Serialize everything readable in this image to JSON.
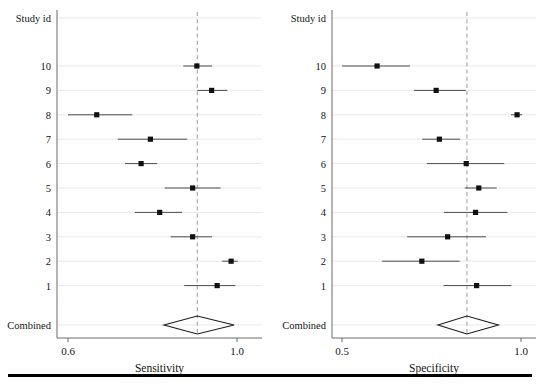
{
  "figure": {
    "title": "",
    "panels": [
      {
        "name": "sensitivity",
        "header": "Study id",
        "axis_title": "Sensitivity",
        "ticks": [
          "0.6",
          "1.0"
        ]
      },
      {
        "name": "specificity",
        "header": "Study id",
        "axis_title": "Specificity",
        "ticks": [
          "0.5",
          "1.0"
        ]
      }
    ],
    "study_labels": [
      "10",
      "9",
      "8",
      "7",
      "6",
      "5",
      "4",
      "3",
      "2",
      "1"
    ],
    "combined_label": "Combined"
  },
  "chart_data": [
    {
      "type": "forest",
      "title": "Sensitivity forest plot",
      "xlabel": "Sensitivity",
      "ylabel": "Study id",
      "xlim": [
        0.555,
        1.02
      ],
      "xticks": [
        0.6,
        1.0
      ],
      "xticklabels": [
        "0.6",
        "1.0"
      ],
      "grid": true,
      "reference_line": 0.906,
      "categories": [
        "10",
        "9",
        "8",
        "7",
        "6",
        "5",
        "4",
        "3",
        "2",
        "1"
      ],
      "estimates": [
        0.905,
        0.94,
        0.668,
        0.795,
        0.773,
        0.895,
        0.817,
        0.895,
        0.986,
        0.953
      ],
      "ci_low": [
        0.873,
        0.906,
        0.6,
        0.718,
        0.735,
        0.829,
        0.758,
        0.843,
        0.965,
        0.875
      ],
      "ci_high": [
        0.941,
        0.977,
        0.752,
        0.882,
        0.811,
        0.961,
        0.87,
        0.941,
        1.002,
        0.996
      ],
      "combined": {
        "label": "Combined",
        "estimate": 0.906,
        "ci_low": 0.827,
        "ci_high": 0.993
      }
    },
    {
      "type": "forest",
      "title": "Specificity forest plot",
      "xlabel": "Specificity",
      "ylabel": "Study id",
      "xlim": [
        0.485,
        1.02
      ],
      "xticks": [
        0.5,
        1.0
      ],
      "xticklabels": [
        "0.5",
        "1.0"
      ],
      "grid": true,
      "reference_line": 0.849,
      "categories": [
        "10",
        "9",
        "8",
        "7",
        "6",
        "5",
        "4",
        "3",
        "2",
        "1"
      ],
      "estimates": [
        0.598,
        0.763,
        0.989,
        0.772,
        0.847,
        0.882,
        0.873,
        0.795,
        0.723,
        0.876
      ],
      "ci_low": [
        0.5,
        0.701,
        0.972,
        0.724,
        0.737,
        0.843,
        0.785,
        0.682,
        0.612,
        0.784
      ],
      "ci_high": [
        0.69,
        0.846,
        1.003,
        0.83,
        0.953,
        0.932,
        0.962,
        0.902,
        0.829,
        0.973
      ],
      "combined": {
        "label": "Combined",
        "estimate": 0.849,
        "ci_low": 0.768,
        "ci_high": 0.937
      }
    }
  ]
}
